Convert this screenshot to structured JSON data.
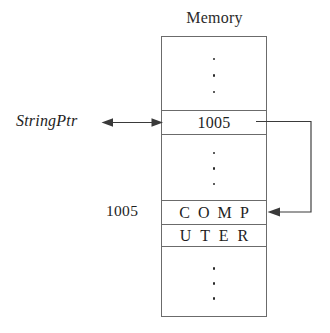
{
  "diagram": {
    "title": "Memory",
    "pointer_variable_label": "StringPtr",
    "pointer_value": "1005",
    "target_address_label": "1005",
    "string_row_1": [
      "C",
      "O",
      "M",
      "P"
    ],
    "string_row_2": [
      "U",
      "T",
      "E",
      "R"
    ],
    "ellipsis_dot_count": 3,
    "colors": {
      "box_stroke": "#6b6b6b",
      "text": "#1e1e1e",
      "connector": "#3a3a3a",
      "background": "#ffffff"
    }
  }
}
